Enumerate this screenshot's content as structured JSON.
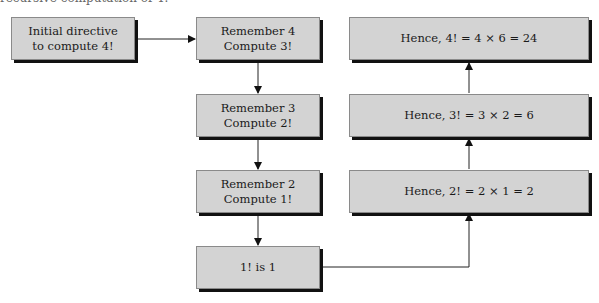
{
  "caption": "recursive computation of 4!",
  "diagram": {
    "title": "Recursive computation of 4!",
    "descent": [
      {
        "id": "initial",
        "lines": [
          "Initial directive",
          "to compute 4!"
        ]
      },
      {
        "id": "step4",
        "lines": [
          "Remember 4",
          "Compute 3!"
        ]
      },
      {
        "id": "step3",
        "lines": [
          "Remember 3",
          "Compute 2!"
        ]
      },
      {
        "id": "step2",
        "lines": [
          "Remember 2",
          "Compute 1!"
        ]
      },
      {
        "id": "base",
        "lines": [
          "1! is 1"
        ]
      }
    ],
    "ascent": [
      {
        "id": "result2",
        "text": "Hence, 2! = 2 × 1 = 2"
      },
      {
        "id": "result3",
        "text": "Hence, 3! = 3 × 2 = 6"
      },
      {
        "id": "result4",
        "text": "Hence, 4! = 4 × 6 = 24"
      }
    ],
    "colors": {
      "box_fill": "#d3d3d3",
      "box_border": "#8a8a8a",
      "shadow": "#111111",
      "line": "#222222"
    }
  }
}
